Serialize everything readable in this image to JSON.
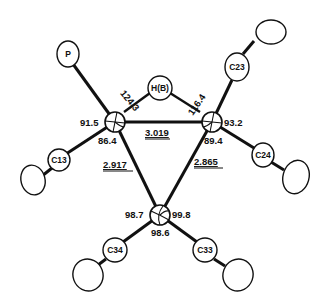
{
  "figure": {
    "type": "ORTEP molecular structure drawing",
    "atoms": {
      "P": "P",
      "H": "H(B)",
      "C23": "C23",
      "C13": "C13",
      "C24": "C24",
      "C34": "C34",
      "C33": "C33"
    },
    "angles": {
      "left_top": "124.3",
      "left_outer": "91.5",
      "left_bottom": "86.4",
      "right_top": "116.4",
      "right_outer": "93.2",
      "right_bottom": "89.4",
      "bottom_left": "98.7",
      "bottom_right": "99.8",
      "bottom_bottom": "98.6"
    },
    "distances": {
      "top": "3.019",
      "left": "2.917",
      "right": "2.865"
    }
  }
}
